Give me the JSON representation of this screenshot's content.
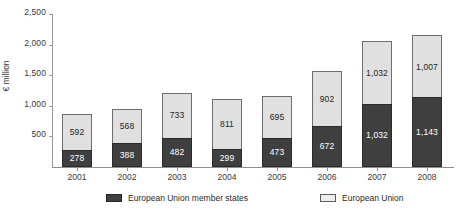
{
  "chart_data": {
    "type": "bar",
    "stacked": true,
    "title": "",
    "xlabel": "",
    "ylabel": "€ million",
    "ylim": [
      0,
      2500
    ],
    "yticks": [
      "500",
      "1,000",
      "1,500",
      "2,000",
      "2,500"
    ],
    "ytick_values": [
      500,
      1000,
      1500,
      2000,
      2500
    ],
    "grid": false,
    "legend_position": "bottom",
    "categories": [
      "2001",
      "2002",
      "2003",
      "2004",
      "2005",
      "2006",
      "2007",
      "2008"
    ],
    "series": [
      {
        "name": "European Union member states",
        "color": "#3f3f3f",
        "values": [
          278,
          388,
          482,
          299,
          473,
          672,
          1032,
          1143
        ],
        "labels": [
          "278",
          "388",
          "482",
          "299",
          "473",
          "672",
          "1,032",
          "1,143"
        ]
      },
      {
        "name": "European Union",
        "color": "#e0e0e0",
        "values": [
          592,
          568,
          733,
          811,
          695,
          902,
          1032,
          1007
        ],
        "labels": [
          "592",
          "568",
          "733",
          "811",
          "695",
          "902",
          "1,032",
          "1,007"
        ]
      }
    ],
    "totals": [
      870,
      956,
      1215,
      1110,
      1168,
      1574,
      2064,
      2150
    ]
  },
  "legend": {
    "items": [
      {
        "label": "European Union member states",
        "swatch": "dark"
      },
      {
        "label": "European Union",
        "swatch": "light"
      }
    ]
  }
}
